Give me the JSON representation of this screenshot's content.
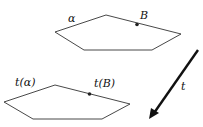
{
  "diagram": {
    "top_plane": {
      "label": "α",
      "point_label": "B"
    },
    "bottom_plane": {
      "label": "t(α)",
      "point_label": "t(B)"
    },
    "arrow": {
      "label": "t"
    },
    "colors": {
      "stroke": "#222222",
      "arrow": "#111111",
      "background": "#ffffff"
    }
  }
}
